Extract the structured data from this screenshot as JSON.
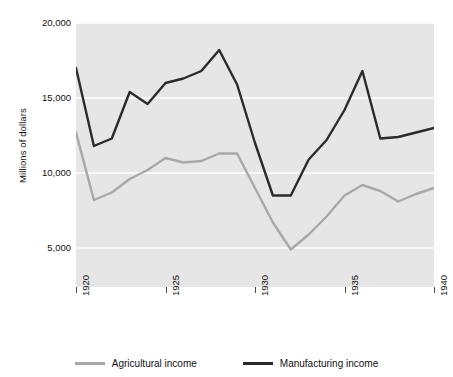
{
  "chart_data": {
    "type": "line",
    "title": "",
    "subtitle": "",
    "xlabel": "",
    "ylabel": "Millions of dollars",
    "xlim": [
      1920,
      1940
    ],
    "ylim": [
      2400,
      20000
    ],
    "grid": true,
    "grid_axis": "y",
    "legend_position": "bottom-center",
    "plot_background": "#e6e6e6",
    "x": [
      1920,
      1921,
      1922,
      1923,
      1924,
      1925,
      1926,
      1927,
      1928,
      1929,
      1930,
      1931,
      1932,
      1933,
      1934,
      1935,
      1936,
      1937,
      1938,
      1939,
      1940
    ],
    "x_tick_values": [
      1920,
      1925,
      1930,
      1935,
      1940
    ],
    "x_tick_labels": [
      "1920",
      "1925",
      "1930",
      "1935",
      "1940"
    ],
    "y_tick_values": [
      5000,
      10000,
      15000,
      20000
    ],
    "y_tick_labels": [
      "5,000",
      "10,000",
      "15,000",
      "20,000"
    ],
    "series": [
      {
        "name": "Agricultural income",
        "color": "#a8a8a8",
        "values": [
          12700,
          8200,
          8700,
          9600,
          10200,
          11000,
          10700,
          10800,
          11300,
          11300,
          9000,
          6700,
          4900,
          5900,
          7100,
          8500,
          9200,
          8800,
          8100,
          8600,
          9000
        ]
      },
      {
        "name": "Manufacturing income",
        "color": "#2b2b2b",
        "values": [
          17000,
          11800,
          12300,
          15400,
          14600,
          16000,
          16300,
          16800,
          18200,
          15900,
          12000,
          8500,
          8500,
          10900,
          12200,
          14200,
          16800,
          12300,
          12400,
          12700,
          13000
        ]
      }
    ]
  },
  "axes": {
    "y_title": "Millions of dollars",
    "y_ticks": [
      {
        "label": "20,000",
        "value": 20000
      },
      {
        "label": "15,000",
        "value": 15000
      },
      {
        "label": "10,000",
        "value": 10000
      },
      {
        "label": "5,000",
        "value": 5000
      }
    ],
    "x_ticks": [
      {
        "label": "1920",
        "value": 1920
      },
      {
        "label": "1925",
        "value": 1925
      },
      {
        "label": "1930",
        "value": 1930
      },
      {
        "label": "1935",
        "value": 1935
      },
      {
        "label": "1940",
        "value": 1940
      }
    ]
  },
  "legend": {
    "items": [
      {
        "label": "Agricultural income",
        "color": "#a8a8a8"
      },
      {
        "label": "Manufacturing income",
        "color": "#2b2b2b"
      }
    ]
  },
  "colors": {
    "agricultural": "#a8a8a8",
    "manufacturing": "#2b2b2b",
    "plot_background": "#e6e6e6",
    "gridline": "#ffffff",
    "page_background": "#ffffff"
  }
}
